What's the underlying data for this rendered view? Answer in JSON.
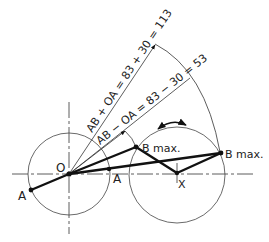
{
  "diagram": {
    "labels": {
      "O": "O",
      "A_left": "A",
      "A_right": "A",
      "B_max_1": "B max.",
      "B_max_2": "B max.",
      "X": "X",
      "ray_sum": "AB + OA = 83 + 30 = 113",
      "ray_diff": "AB − OA = 83 − 30 = 53"
    },
    "values": {
      "AB": 83,
      "OA": 30,
      "sum": 113,
      "difference": 53
    },
    "points": {
      "O": [
        69,
        174
      ],
      "A_left": [
        31,
        190
      ],
      "A_right": [
        109,
        170
      ],
      "B_max_1": [
        136,
        147
      ],
      "B_max_2": [
        221,
        153
      ],
      "X": [
        177,
        173
      ]
    },
    "circles": [
      {
        "name": "crank-circle",
        "center": [
          69,
          174
        ],
        "r": 41
      },
      {
        "name": "rocker-circle",
        "center": [
          177,
          175
        ],
        "r": 48
      }
    ]
  }
}
